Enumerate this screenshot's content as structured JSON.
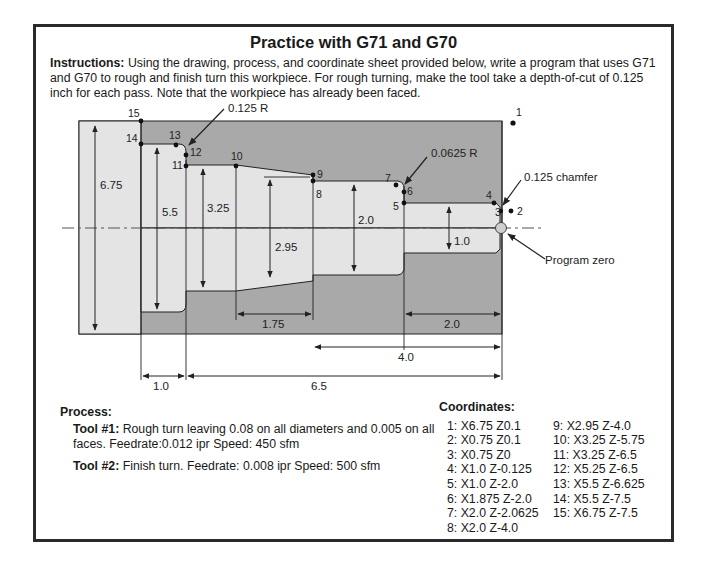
{
  "title": "Practice with G71 and G70",
  "instructions": {
    "label": "Instructions:",
    "text": " Using the drawing, process, and coordinate sheet provided below, write a program that uses G71 and G70 to rough and finish turn this workpiece. For rough turning, make the tool take a depth-of-cut of 0.125 inch for each pass. Note that the workpiece has already been faced."
  },
  "drawing": {
    "callouts": {
      "radius_large": "0.125 R",
      "radius_small": "0.0625 R",
      "chamfer": "0.125 chamfer",
      "program_zero": "Program zero"
    },
    "point_labels": [
      "1",
      "2",
      "3",
      "4",
      "5",
      "6",
      "7",
      "8",
      "9",
      "10",
      "11",
      "12",
      "13",
      "14",
      "15"
    ],
    "diameter_dims": {
      "d675": "6.75",
      "d55": "5.5",
      "d325": "3.25",
      "d295": "2.95",
      "d20": "2.0",
      "d10": "1.0"
    },
    "length_dims": {
      "l175": "1.75",
      "l20": "2.0",
      "l40": "4.0",
      "l10": "1.0",
      "l65": "6.5"
    },
    "colors": {
      "stock": "#a9a9a9",
      "part": "#e4e4e4",
      "line": "#222222"
    }
  },
  "process": {
    "header": "Process:",
    "tools": [
      {
        "label": "Tool #1:",
        "text": " Rough turn leaving 0.08 on all diameters and 0.005 on all faces.  Feedrate:0.012 ipr  Speed: 450 sfm"
      },
      {
        "label": "Tool #2:",
        "text": " Finish turn.  Feedrate: 0.008 ipr  Speed: 500 sfm"
      }
    ]
  },
  "coordinates": {
    "header": "Coordinates:",
    "col1": [
      "1: X6.75 Z0.1",
      "2: X0.75 Z0.1",
      "3: X0.75 Z0",
      "4: X1.0 Z-0.125",
      "5: X1.0 Z-2.0",
      "6: X1.875 Z-2.0",
      "7: X2.0 Z-2.0625",
      "8: X2.0 Z-4.0"
    ],
    "col2": [
      "9: X2.95 Z-4.0",
      "10: X3.25 Z-5.75",
      "11: X3.25 Z-6.5",
      "12: X5.25 Z-6.5",
      "13: X5.5 Z-6.625",
      "14: X5.5 Z-7.5",
      "15: X6.75 Z-7.5"
    ]
  }
}
